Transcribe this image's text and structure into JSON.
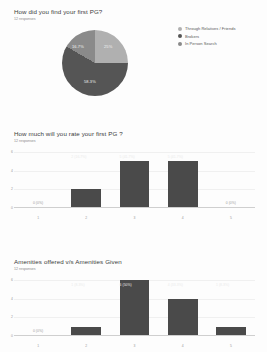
{
  "chart_data": [
    {
      "type": "pie",
      "title": "How did you find your first PG?",
      "subtitle": "12 responses",
      "categories": [
        "Through Relatives / Friends",
        "Brokers",
        "In Person Search"
      ],
      "values": [
        25,
        58.3,
        16.7
      ],
      "labels": [
        "25%",
        "58.3%",
        "16.7%"
      ],
      "colors": [
        "#b0b0b0",
        "#555555",
        "#8a8a8a"
      ],
      "legend_position": "right"
    },
    {
      "type": "bar",
      "title": "How much will you rate your first PG ?",
      "subtitle": "12 responses",
      "categories": [
        "1",
        "2",
        "3",
        "4",
        "5"
      ],
      "values": [
        0,
        2,
        5,
        5,
        0
      ],
      "data_labels": [
        "0 (0%)",
        "2 (16.7%)",
        "5 (41.7%)",
        "5 (41.7%)",
        "0 (0%)"
      ],
      "xlabel": "",
      "ylabel": "",
      "ylim": [
        0,
        6
      ],
      "yticks": [
        "0",
        "2",
        "4",
        "6"
      ],
      "grid": true,
      "bar_color": "#4a4a4a"
    },
    {
      "type": "bar",
      "title": "Amenities offered v/s Amenities Given",
      "subtitle": "12 responses",
      "categories": [
        "1",
        "2",
        "3",
        "4",
        "5"
      ],
      "values": [
        0,
        1,
        6,
        4,
        1
      ],
      "data_labels": [
        "0 (0%)",
        "1 (8.3%)",
        "6 (50%)",
        "4 (33.3%)",
        "1 (8.3%)"
      ],
      "xlabel": "",
      "ylabel": "",
      "ylim": [
        0,
        6
      ],
      "yticks": [
        "0",
        "2",
        "4",
        "6"
      ],
      "grid": true,
      "bar_color": "#4a4a4a"
    }
  ]
}
